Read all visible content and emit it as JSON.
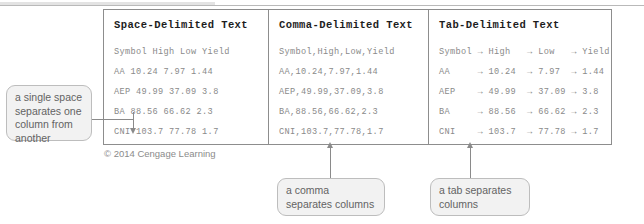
{
  "figure": {
    "copyright": "© 2014 Cengage Learning"
  },
  "columns": [
    {
      "title": "Space-Delimited Text",
      "lines": [
        "Symbol High Low Yield",
        "AA 10.24 7.97 1.44",
        "AEP 49.99 37.09 3.8",
        "BA 88.56 66.62 2.3",
        "CNI 103.7 77.78 1.7"
      ]
    },
    {
      "title": "Comma-Delimited Text",
      "lines": [
        "Symbol,High,Low,Yield",
        "AA,10.24,7.97,1.44",
        "AEP,49.99,37.09,3.8",
        "BA,88.56,66.62,2.3",
        "CNI,103.7,77.78,1.7"
      ]
    },
    {
      "title": "Tab-Delimited Text",
      "lines": [
        "Symbol → High   → Low   → Yield",
        "AA     → 10.24  → 7.97  → 1.44",
        "AEP    → 49.99  → 37.09 → 3.8",
        "BA     → 88.56  → 66.62 → 2.3",
        "CNI    → 103.7  → 77.78 → 1.7"
      ]
    }
  ],
  "callouts": {
    "space": "a single space separates one column from another",
    "comma": "a comma separates columns",
    "tab": "a tab separates columns"
  }
}
